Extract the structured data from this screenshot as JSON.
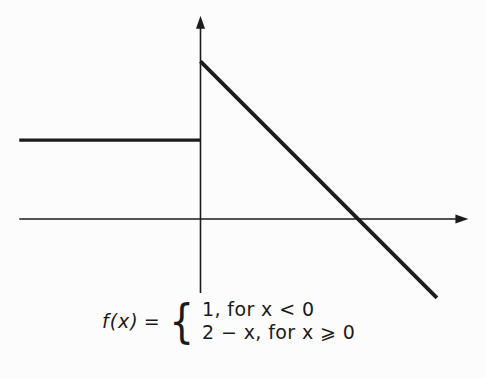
{
  "figure": {
    "background": "#fcfcfc",
    "ink": "#1b1b1b"
  },
  "chart_data": {
    "type": "line",
    "title": "",
    "xlabel": "",
    "ylabel": "",
    "xlim": [
      -2.3,
      3.4
    ],
    "ylim": [
      -0.94,
      2.58
    ],
    "grid": false,
    "tick_labels": "none",
    "legend": "none",
    "axes_style": "arrow-tipped x axis and y axis crossing at origin",
    "series": [
      {
        "name": "f(x) = 1, for x < 0",
        "x": [
          -2.3,
          0
        ],
        "y": [
          1,
          1
        ]
      },
      {
        "name": "f(x) = 2 − x, for x ⩾ 0",
        "x": [
          0,
          3
        ],
        "y": [
          2,
          -1
        ]
      }
    ],
    "features": {
      "jump_discontinuity_at_x": 0,
      "left_limit_at_0": 1,
      "value_at_0": 2,
      "x_intercept_of_linear_piece": 2
    }
  },
  "caption": {
    "lhs": "f(x)",
    "equals": "=",
    "brace": "{",
    "cases": [
      "1, for x < 0",
      "2 − x, for x ⩾ 0"
    ]
  }
}
